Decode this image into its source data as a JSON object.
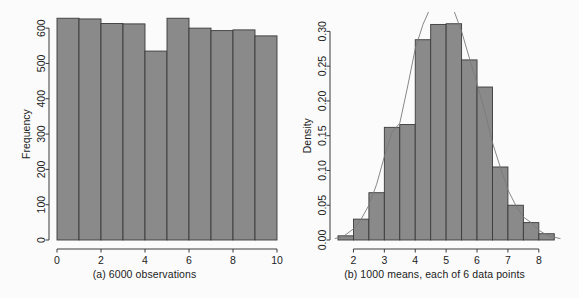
{
  "figure": {
    "background_color": "#fbfbfb",
    "bar_fill_color": "#8a8a8a",
    "bar_border_color": "#3a3a3a",
    "axis_color": "#3a3a3a",
    "curve_color": "#7a7a7a"
  },
  "panel_a": {
    "caption": "(a) 6000 observations",
    "ylabel": "Frequency",
    "xlabel": "",
    "y_ticks": [
      "0",
      "100",
      "200",
      "300",
      "400",
      "500",
      "600"
    ],
    "x_ticks": [
      "0",
      "2",
      "4",
      "6",
      "8",
      "10"
    ]
  },
  "panel_b": {
    "caption": "(b) 1000 means, each of 6 data points",
    "ylabel": "Density",
    "xlabel": "",
    "y_ticks": [
      "0.00",
      "0.05",
      "0.10",
      "0.15",
      "0.20",
      "0.25",
      "0.30"
    ],
    "x_ticks": [
      "2",
      "3",
      "4",
      "5",
      "6",
      "7",
      "8"
    ]
  },
  "chart_data": [
    {
      "type": "bar",
      "title": "(a) 6000 observations",
      "xlabel": "",
      "ylabel": "Frequency",
      "xlim": [
        0,
        10
      ],
      "ylim": [
        0,
        640
      ],
      "grid": false,
      "legend": null,
      "bin_edges": [
        0,
        1,
        2,
        3,
        4,
        5,
        6,
        7,
        8,
        9,
        10
      ],
      "categories": [
        "0-1",
        "1-2",
        "2-3",
        "3-4",
        "4-5",
        "5-6",
        "6-7",
        "7-8",
        "8-9",
        "9-10"
      ],
      "values": [
        628,
        626,
        613,
        612,
        535,
        628,
        600,
        593,
        595,
        578
      ],
      "y_tick_values": [
        0,
        100,
        200,
        300,
        400,
        500,
        600
      ],
      "x_tick_values": [
        0,
        2,
        4,
        6,
        8,
        10
      ]
    },
    {
      "type": "bar",
      "title": "(b) 1000 means, each of 6 data points",
      "xlabel": "",
      "ylabel": "Density",
      "xlim": [
        1.5,
        8.75
      ],
      "ylim": [
        0,
        0.325
      ],
      "grid": false,
      "legend": null,
      "bin_width": 0.5,
      "bin_edges": [
        1.5,
        2.0,
        2.5,
        3.0,
        3.5,
        4.0,
        4.5,
        5.0,
        5.5,
        6.0,
        6.5,
        7.0,
        7.5,
        8.0,
        8.5
      ],
      "categories": [
        "1.5-2.0",
        "2.0-2.5",
        "2.5-3.0",
        "3.0-3.5",
        "3.5-4.0",
        "4.0-4.5",
        "4.5-5.0",
        "5.0-5.5",
        "5.5-6.0",
        "6.0-6.5",
        "6.5-7.0",
        "7.0-7.5",
        "7.5-8.0",
        "8.0-8.5"
      ],
      "values": [
        0.006,
        0.03,
        0.068,
        0.162,
        0.166,
        0.288,
        0.31,
        0.311,
        0.259,
        0.22,
        0.105,
        0.05,
        0.025,
        0.009
      ],
      "y_tick_values": [
        0.0,
        0.05,
        0.1,
        0.15,
        0.2,
        0.25,
        0.3
      ],
      "x_tick_values": [
        2,
        3,
        4,
        5,
        6,
        7,
        8
      ],
      "overlay_curve": {
        "name": "density",
        "x": [
          1.4,
          1.7,
          2.0,
          2.25,
          2.5,
          2.75,
          3.0,
          3.25,
          3.5,
          3.75,
          4.0,
          4.25,
          4.5,
          4.75,
          5.0,
          5.25,
          5.5,
          5.75,
          6.0,
          6.25,
          6.5,
          6.75,
          7.0,
          7.25,
          7.5,
          7.75,
          8.0,
          8.3,
          8.7
        ],
        "y": [
          0.002,
          0.006,
          0.016,
          0.03,
          0.05,
          0.08,
          0.12,
          0.155,
          0.168,
          0.22,
          0.275,
          0.31,
          0.335,
          0.345,
          0.34,
          0.33,
          0.3,
          0.262,
          0.225,
          0.185,
          0.14,
          0.105,
          0.072,
          0.05,
          0.033,
          0.025,
          0.014,
          0.006,
          0.002
        ]
      }
    }
  ]
}
